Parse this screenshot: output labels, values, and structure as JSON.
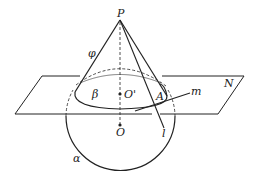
{
  "diagram": {
    "type": "geometry-3d",
    "labels": {
      "apex": "P",
      "cone_side": "φ",
      "section": "β",
      "section_center": "O'",
      "point_A": "A",
      "line_m": "m",
      "plane": "N",
      "sphere_center": "O",
      "line_l": "l",
      "sphere": "α"
    },
    "colors": {
      "stroke": "#222222",
      "background": "#ffffff"
    }
  }
}
